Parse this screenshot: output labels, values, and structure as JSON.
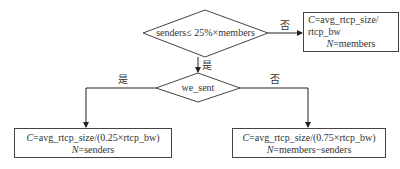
{
  "decision1": {
    "text": "senders≤ 25%×members",
    "yes_label": "是",
    "no_label": "否"
  },
  "decision2": {
    "text": "we_sent",
    "yes_label": "是",
    "no_label": "否"
  },
  "box_members": {
    "c_var": "C",
    "c_expr": "=avg_rtcp_size/",
    "c_expr2": "rtcp_bw",
    "n_var": "N",
    "n_expr": "=members"
  },
  "box_senders": {
    "c_var": "C",
    "c_expr": "=avg_rtcp_size/(0.25×rtcp_bw)",
    "n_var": "N",
    "n_expr": "=senders"
  },
  "box_receivers": {
    "c_var": "C",
    "c_expr": "=avg_rtcp_size/(0.75×rtcp_bw)",
    "n_var": "N",
    "n_expr": "=members−senders"
  }
}
